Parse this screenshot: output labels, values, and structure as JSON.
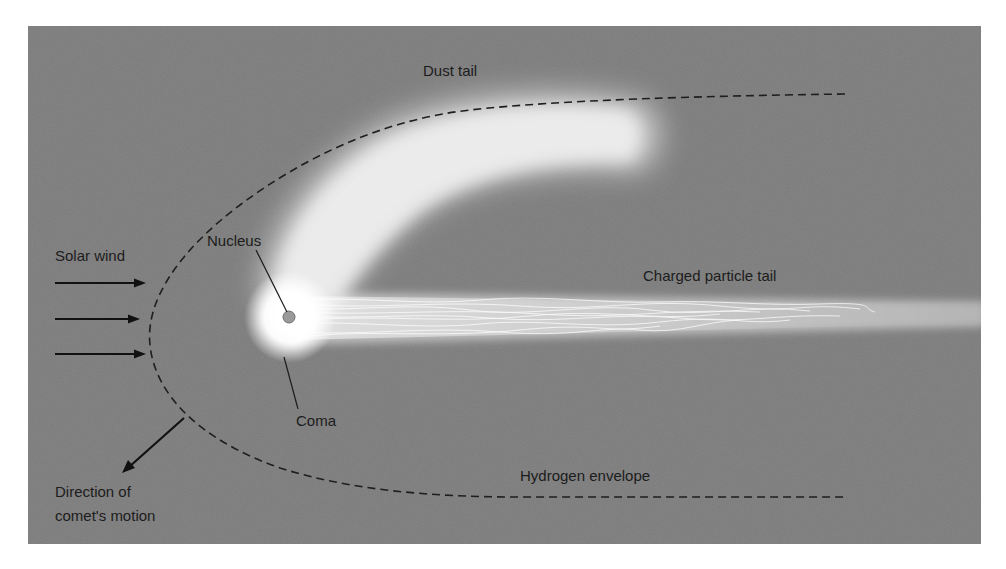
{
  "diagram": {
    "colors": {
      "background": "#7b7b7b",
      "page": "#ffffff",
      "text": "#1c1c1c",
      "glow": "#ffffff",
      "dashed_line": "#1e1e1e",
      "nucleus_fill": "#9a9a9a"
    },
    "labels": {
      "dust_tail": "Dust tail",
      "solar_wind": "Solar wind",
      "nucleus": "Nucleus",
      "charged_particle_tail": "Charged particle tail",
      "coma": "Coma",
      "hydrogen_envelope": "Hydrogen envelope",
      "direction_line1": "Direction of",
      "direction_line2": "comet's motion"
    },
    "solar_wind_arrows": 3
  }
}
